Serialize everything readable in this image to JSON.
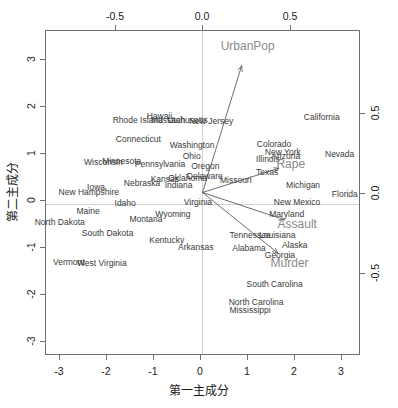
{
  "chart_data": {
    "type": "scatter",
    "subtype": "pca-biplot",
    "title": "",
    "xlabel": "第一主成分",
    "ylabel": "第二主成分",
    "xlim": [
      -3.3,
      3.3
    ],
    "ylim": [
      -3.3,
      3.3
    ],
    "x_ticks": [
      "-3",
      "-2",
      "-1",
      "0",
      "1",
      "2",
      "3"
    ],
    "y_ticks": [
      "-3",
      "-2",
      "-1",
      "0",
      "1",
      "2",
      "3"
    ],
    "x_ticks_top": [
      "-0.5",
      "0.0",
      "0.5"
    ],
    "y_ticks_right": [
      "-0.5",
      "0.0",
      "0.5"
    ],
    "top_axis_lim": [
      -0.94,
      0.94
    ],
    "right_axis_lim": [
      -0.94,
      0.94
    ],
    "grid": false,
    "legend": "none",
    "point_color": "#3a3a3a",
    "arrow_color": "#4a4a4a",
    "variable_label_color": "#8a8a8a",
    "zeroline_color": "#d2d2d2",
    "frame_color": "#6e6e6e",
    "points": [
      {
        "label": "Alabama",
        "x": 0.976,
        "y": -1.122
      },
      {
        "label": "Alaska",
        "x": 1.931,
        "y": -1.062
      },
      {
        "label": "Arizona",
        "x": 1.745,
        "y": 0.738
      },
      {
        "label": "Arkansas",
        "x": -0.14,
        "y": -1.109
      },
      {
        "label": "California",
        "x": 2.499,
        "y": 1.527
      },
      {
        "label": "Colorado",
        "x": 1.499,
        "y": 0.978
      },
      {
        "label": "Connecticut",
        "x": -1.345,
        "y": 1.077
      },
      {
        "label": "Delaware",
        "x": 0.047,
        "y": 0.325
      },
      {
        "label": "Florida",
        "x": 2.982,
        "y": -0.039
      },
      {
        "label": "Georgia",
        "x": 1.622,
        "y": -1.266
      },
      {
        "label": "Hawaii",
        "x": -0.903,
        "y": 1.55
      },
      {
        "label": "Idaho",
        "x": -1.62,
        "y": -0.21
      },
      {
        "label": "Illinois",
        "x": 1.371,
        "y": 0.675
      },
      {
        "label": "Indiana",
        "x": -0.501,
        "y": 0.151
      },
      {
        "label": "Iowa",
        "x": -2.23,
        "y": 0.102
      },
      {
        "label": "Kansas",
        "x": -0.789,
        "y": 0.271
      },
      {
        "label": "Kentucky",
        "x": -0.75,
        "y": -0.958
      },
      {
        "label": "Louisiana",
        "x": 1.565,
        "y": -0.871
      },
      {
        "label": "Maine",
        "x": -2.397,
        "y": -0.376
      },
      {
        "label": "Maryland",
        "x": 1.763,
        "y": -0.428
      },
      {
        "label": "Massachusetts",
        "x": -0.486,
        "y": 1.474
      },
      {
        "label": "Michigan",
        "x": 2.108,
        "y": 0.155
      },
      {
        "label": "Minnesota",
        "x": -1.692,
        "y": 0.632
      },
      {
        "label": "Mississippi",
        "x": 0.997,
        "y": -2.394
      },
      {
        "label": "Missouri",
        "x": 0.697,
        "y": 0.263
      },
      {
        "label": "Montana",
        "x": -1.185,
        "y": -0.536
      },
      {
        "label": "Nebraska",
        "x": -1.266,
        "y": 0.194
      },
      {
        "label": "Nevada",
        "x": 2.874,
        "y": 0.776
      },
      {
        "label": "New Hampshire",
        "x": -2.383,
        "y": 0.018
      },
      {
        "label": "New Jersey",
        "x": 0.181,
        "y": 1.449
      },
      {
        "label": "New Mexico",
        "x": 1.98,
        "y": -0.192
      },
      {
        "label": "New York",
        "x": 1.683,
        "y": 0.823
      },
      {
        "label": "North Carolina",
        "x": 1.123,
        "y": -2.228
      },
      {
        "label": "North Dakota",
        "x": -2.992,
        "y": -0.599
      },
      {
        "label": "Ohio",
        "x": -0.226,
        "y": 0.742
      },
      {
        "label": "Oklahoma",
        "x": -0.312,
        "y": 0.287
      },
      {
        "label": "Oregon",
        "x": 0.059,
        "y": 0.541
      },
      {
        "label": "Pennsylvania",
        "x": -0.889,
        "y": 0.571
      },
      {
        "label": "Rhode Island",
        "x": -1.358,
        "y": 1.478
      },
      {
        "label": "South Carolina",
        "x": 1.512,
        "y": -1.857
      },
      {
        "label": "South Dakota",
        "x": -1.988,
        "y": -0.824
      },
      {
        "label": "Tennessee",
        "x": 0.999,
        "y": -0.86
      },
      {
        "label": "Texas",
        "x": 1.355,
        "y": 0.412
      },
      {
        "label": "Utah",
        "x": -0.551,
        "y": 1.471
      },
      {
        "label": "Vermont",
        "x": -2.801,
        "y": -1.403
      },
      {
        "label": "Virginia",
        "x": -0.096,
        "y": -0.199
      },
      {
        "label": "Washington",
        "x": -0.217,
        "y": 0.97
      },
      {
        "label": "West Virginia",
        "x": -2.109,
        "y": -1.424
      },
      {
        "label": "Wisconsin",
        "x": -2.075,
        "y": 0.611
      },
      {
        "label": "Wyoming",
        "x": -0.62,
        "y": -0.444
      }
    ],
    "loadings": [
      {
        "label": "Murder",
        "x": 0.536,
        "y": -0.418
      },
      {
        "label": "Assault",
        "x": 0.583,
        "y": -0.188
      },
      {
        "label": "UrbanPop",
        "x": 0.278,
        "y": 0.873
      },
      {
        "label": "Rape",
        "x": 0.543,
        "y": 0.167
      }
    ]
  }
}
